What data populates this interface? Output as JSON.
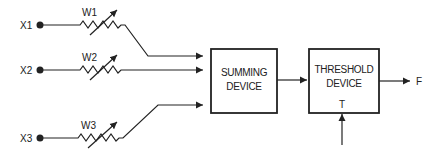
{
  "diagram": {
    "type": "perceptron-block-diagram",
    "inputs": [
      {
        "label": "X1",
        "weight": "W1"
      },
      {
        "label": "X2",
        "weight": "W2"
      },
      {
        "label": "X3",
        "weight": "W3"
      }
    ],
    "blocks": {
      "summing": {
        "line1": "SUMMING",
        "line2": "DEVICE"
      },
      "threshold": {
        "line1": "THRESHOLD",
        "line2": "DEVICE",
        "input_label": "T"
      }
    },
    "output": {
      "label": "F"
    },
    "colors": {
      "line": "#222222",
      "background": "#ffffff"
    }
  }
}
